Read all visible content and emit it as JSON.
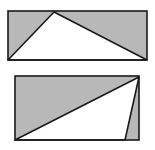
{
  "figures": [
    {
      "name": "top-rectangle",
      "rect": {
        "x": 8,
        "y": 11,
        "w": 139,
        "h": 49
      },
      "triangle": [
        [
          8,
          60
        ],
        [
          54,
          12
        ],
        [
          147,
          60
        ]
      ],
      "shaded_regions": "corners outside triangle"
    },
    {
      "name": "bottom-rectangle",
      "rect": {
        "x": 15,
        "y": 76,
        "w": 124,
        "h": 64
      },
      "triangle": [
        [
          15,
          140
        ],
        [
          139,
          77
        ],
        [
          125,
          140
        ]
      ],
      "shaded_regions": "areas outside triangle"
    }
  ],
  "colors": {
    "shade": "#b8b8b8",
    "stroke": "#1a1a1a",
    "background": "#ffffff"
  }
}
